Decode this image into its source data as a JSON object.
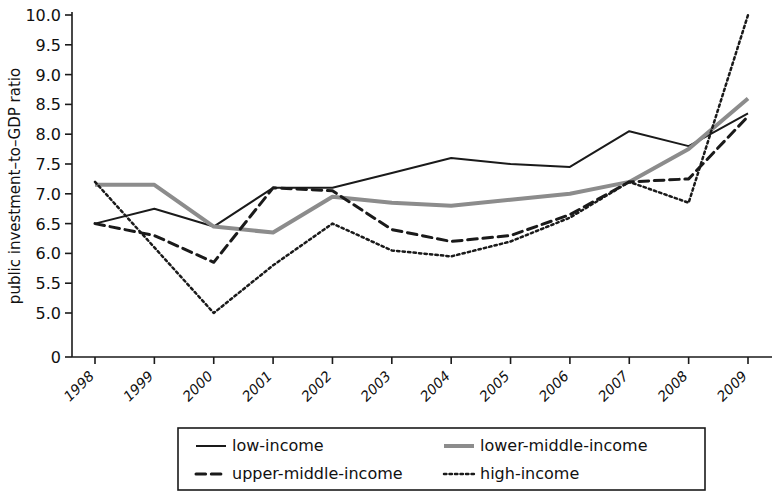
{
  "chart_data": {
    "type": "line",
    "title": "",
    "subtitle": "",
    "xlabel": "",
    "ylabel": "public investment–to–GDP ratio",
    "x": [
      "1998",
      "1999",
      "2000",
      "2001",
      "2002",
      "2003",
      "2004",
      "2005",
      "2006",
      "2007",
      "2008",
      "2009"
    ],
    "categories": [
      "1998",
      "1999",
      "2000",
      "2001",
      "2002",
      "2003",
      "2004",
      "2005",
      "2006",
      "2007",
      "2008",
      "2009"
    ],
    "ytick_labels": [
      "10.0",
      "9.5",
      "9.0",
      "8.5",
      "8.0",
      "7.5",
      "7.0",
      "6.5",
      "6.0",
      "5.5",
      "5.0",
      "0"
    ],
    "ytick_values": [
      10.0,
      9.5,
      9.0,
      8.5,
      8.0,
      7.5,
      7.0,
      6.5,
      6.0,
      5.5,
      5.0,
      0
    ],
    "ylim": [
      5.0,
      10.0
    ],
    "y_axis_break": true,
    "grid": false,
    "legend_position": "bottom",
    "series": [
      {
        "name": "low-income",
        "style": "solid",
        "color": "#1a1a1a",
        "width": 2,
        "values": [
          6.5,
          6.75,
          6.45,
          7.1,
          7.1,
          7.35,
          7.6,
          7.5,
          7.45,
          8.05,
          7.8,
          8.35
        ]
      },
      {
        "name": "lower-middle-income",
        "style": "solid",
        "color": "#8c8c8c",
        "width": 4,
        "values": [
          7.15,
          7.15,
          6.45,
          6.35,
          6.95,
          6.85,
          6.8,
          6.9,
          7.0,
          7.2,
          7.75,
          8.6
        ]
      },
      {
        "name": "upper-middle-income",
        "style": "dashed",
        "color": "#1a1a1a",
        "width": 3,
        "values": [
          6.5,
          6.3,
          5.85,
          7.1,
          7.05,
          6.4,
          6.2,
          6.3,
          6.65,
          7.2,
          7.25,
          8.3
        ]
      },
      {
        "name": "high-income",
        "style": "dotted",
        "color": "#1a1a1a",
        "width": 2.5,
        "values": [
          7.2,
          6.1,
          5.0,
          5.8,
          6.5,
          6.05,
          5.95,
          6.2,
          6.6,
          7.2,
          6.85,
          10.0
        ]
      }
    ]
  },
  "legend": {
    "items": [
      {
        "label": "low-income",
        "key": "low-income"
      },
      {
        "label": "lower-middle-income",
        "key": "lower-middle-income"
      },
      {
        "label": "upper-middle-income",
        "key": "upper-middle-income"
      },
      {
        "label": "high-income",
        "key": "high-income"
      }
    ]
  }
}
